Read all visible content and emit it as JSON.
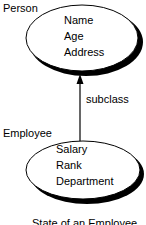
{
  "diagram": {
    "superclass": {
      "name": "Person",
      "attributes": [
        "Name",
        "Age",
        "Address"
      ]
    },
    "subclass": {
      "name": "Employee",
      "attributes": [
        "Salary",
        "Rank",
        "Department"
      ]
    },
    "relationship": {
      "label": "subclass",
      "from": "Employee",
      "to": "Person"
    },
    "caption": "State of an Employee"
  }
}
